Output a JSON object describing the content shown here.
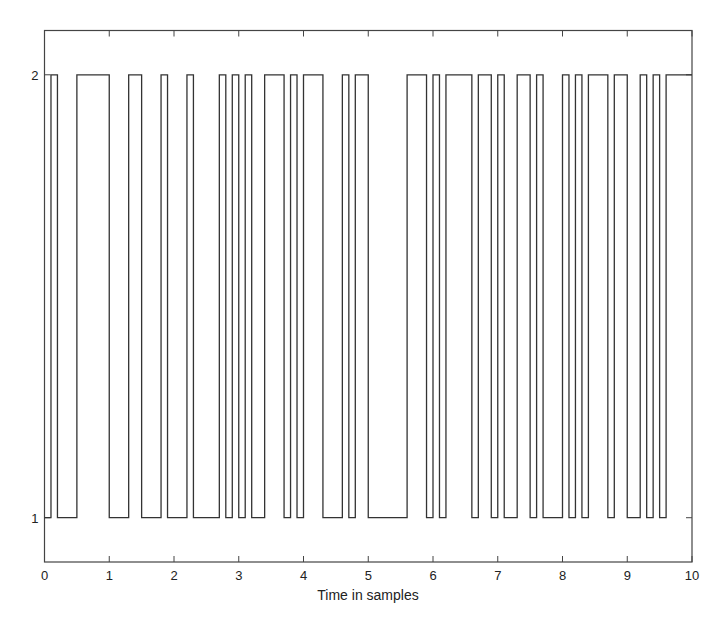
{
  "chart_data": {
    "type": "line",
    "subtype": "step",
    "title": "",
    "xlabel": "Time in samples",
    "ylabel": "",
    "xlim": [
      0,
      10
    ],
    "ylim": [
      0.9,
      2.1
    ],
    "grid": false,
    "legend": null,
    "x_ticks": [
      0,
      1,
      2,
      3,
      4,
      5,
      6,
      7,
      8,
      9,
      10
    ],
    "x_tick_labels": [
      "0",
      "1",
      "2",
      "3",
      "4",
      "5",
      "6",
      "7",
      "8",
      "9",
      "10"
    ],
    "y_ticks": [
      1,
      2
    ],
    "y_tick_labels": [
      "1",
      "2"
    ],
    "sample_interval": 0.1,
    "series": [
      {
        "name": "binary signal",
        "color": "#333333",
        "values": [
          1,
          2,
          1,
          1,
          1,
          2,
          2,
          2,
          2,
          2,
          1,
          1,
          1,
          2,
          2,
          1,
          1,
          1,
          2,
          1,
          1,
          1,
          2,
          1,
          1,
          1,
          1,
          2,
          1,
          2,
          1,
          2,
          1,
          1,
          2,
          2,
          2,
          1,
          2,
          1,
          2,
          2,
          2,
          1,
          1,
          1,
          2,
          1,
          2,
          2,
          1,
          1,
          1,
          1,
          1,
          1,
          2,
          2,
          2,
          1,
          2,
          1,
          2,
          2,
          2,
          2,
          1,
          2,
          2,
          1,
          2,
          1,
          1,
          2,
          2,
          1,
          2,
          1,
          1,
          1,
          2,
          1,
          2,
          1,
          2,
          2,
          2,
          1,
          2,
          2,
          1,
          1,
          2,
          1,
          2,
          1,
          2,
          2,
          2,
          2
        ]
      }
    ]
  }
}
